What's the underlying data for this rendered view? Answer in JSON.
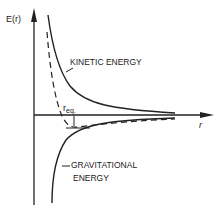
{
  "diagram": {
    "y_axis_label": "E(r)",
    "x_axis_label": "r",
    "kinetic_label": "KINETIC ENERGY",
    "gravitational_label_line1": "GRAVITATIONAL",
    "gravitational_label_line2": "ENERGY",
    "equilibrium_label_main": "r",
    "equilibrium_label_sub": "eq.",
    "colors": {
      "ink": "#222222",
      "background": "#ffffff"
    }
  }
}
